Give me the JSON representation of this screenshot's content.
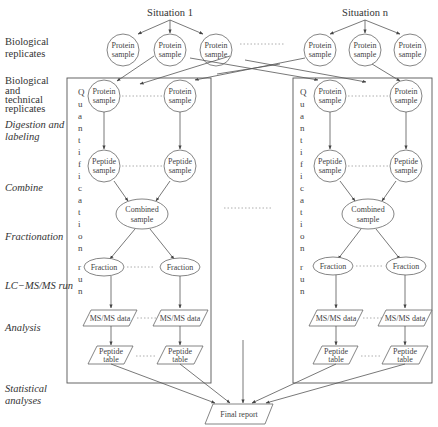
{
  "diagram": {
    "situations": [
      {
        "label": "Situation 1"
      },
      {
        "label": "Situation n"
      }
    ],
    "row_labels": [
      {
        "text": "Biological",
        "style": "normal"
      },
      {
        "text": "replicates",
        "style": "normal"
      },
      {
        "text": "Biological",
        "style": "normal"
      },
      {
        "text": "and",
        "style": "normal"
      },
      {
        "text": "technical",
        "style": "normal"
      },
      {
        "text": "replicates",
        "style": "normal"
      },
      {
        "text": "Digestion and",
        "style": "italic"
      },
      {
        "text": "labeling",
        "style": "italic"
      },
      {
        "text": "Combine",
        "style": "italic"
      },
      {
        "text": "Fractionation",
        "style": "italic"
      },
      {
        "text": "LC−MS/MS run",
        "style": "italic"
      },
      {
        "text": "Analysis",
        "style": "italic"
      },
      {
        "text": "Statistical",
        "style": "italic"
      },
      {
        "text": "analyses",
        "style": "italic"
      }
    ],
    "vertical_label": [
      "Q",
      "u",
      "a",
      "n",
      "t",
      "i",
      "f",
      "i",
      "c",
      "a",
      "t",
      "i",
      "o",
      "n",
      "",
      "r",
      "u",
      "n"
    ],
    "nodes": {
      "protein_l1": "Protein",
      "protein_l2": "sample",
      "peptide_l1": "Peptide",
      "peptide_l2": "sample",
      "combined_l1": "Combined",
      "combined_l2": "sample",
      "fraction": "Fraction",
      "msms": "MS/MS data",
      "ptable_l1": "Peptide",
      "ptable_l2": "table",
      "final_report": "Final report"
    },
    "ellipsis_dots": "............"
  }
}
